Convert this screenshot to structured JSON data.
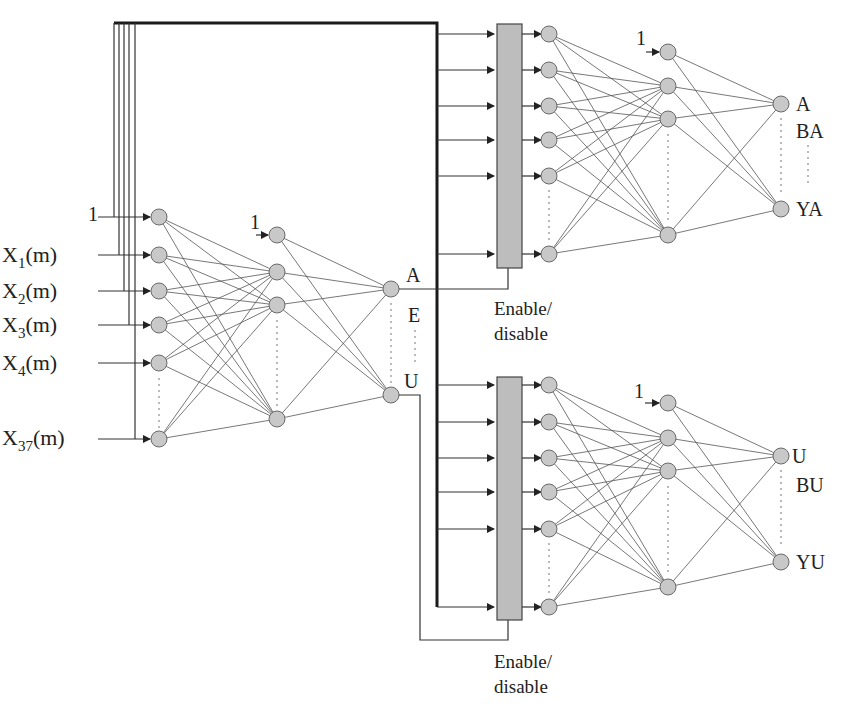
{
  "diagram": {
    "type": "neural-network-architecture",
    "first_network": {
      "inputs": [
        {
          "label": "1",
          "sub": ""
        },
        {
          "label": "X",
          "sub": "1",
          "suffix": "(m)"
        },
        {
          "label": "X",
          "sub": "2",
          "suffix": "(m)"
        },
        {
          "label": "X",
          "sub": "3",
          "suffix": "(m)"
        },
        {
          "label": "X",
          "sub": "4",
          "suffix": "(m)"
        },
        {
          "label": "X",
          "sub": "37",
          "suffix": "(m)"
        }
      ],
      "hidden_bias_label": "1",
      "outputs": {
        "top": "A",
        "middle": "E",
        "bottom": "U"
      }
    },
    "top_subnetwork": {
      "switch_label_line1": "Enable/",
      "switch_label_line2": "disable",
      "hidden_bias_label": "1",
      "outputs": {
        "top": "A",
        "middle": "BA",
        "bottom": "YA"
      }
    },
    "bottom_subnetwork": {
      "switch_label_line1": "Enable/",
      "switch_label_line2": "disable",
      "hidden_bias_label": "1",
      "outputs": {
        "top": "U",
        "middle": "BU",
        "bottom": "YU"
      }
    }
  }
}
